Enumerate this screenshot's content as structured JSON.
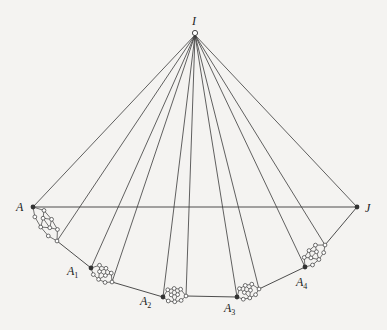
{
  "diagram": {
    "type": "geometric-construction",
    "colors": {
      "line": "#3a3a3a",
      "node_fill": "#ffffff",
      "joint_fill": "#333333",
      "background": "#f4f3f1"
    },
    "apex": {
      "label": "I",
      "x": 195,
      "y": 33
    },
    "baseline": {
      "from": "A",
      "to": "J"
    },
    "points": [
      {
        "id": "A",
        "label": "A",
        "sub": "",
        "x": 33,
        "y": 207,
        "label_x": 16,
        "label_y": 211
      },
      {
        "id": "A1",
        "label": "A",
        "sub": "1",
        "x": 91,
        "y": 268,
        "label_x": 67,
        "label_y": 275
      },
      {
        "id": "A2",
        "label": "A",
        "sub": "2",
        "x": 163,
        "y": 297,
        "label_x": 140,
        "label_y": 305
      },
      {
        "id": "A3",
        "label": "A",
        "sub": "3",
        "x": 237,
        "y": 297,
        "label_x": 224,
        "label_y": 312
      },
      {
        "id": "A4",
        "label": "A",
        "sub": "4",
        "x": 305,
        "y": 267,
        "label_x": 296,
        "label_y": 286
      },
      {
        "id": "J",
        "label": "J",
        "sub": "",
        "x": 357,
        "y": 207,
        "label_x": 365,
        "label_y": 212
      }
    ],
    "segments": [
      {
        "from": [
          33,
          207
        ],
        "to": [
          57,
          241
        ]
      },
      {
        "from": [
          91,
          268
        ],
        "to": [
          112,
          282
        ]
      },
      {
        "from": [
          163,
          297
        ],
        "to": [
          186,
          296
        ]
      },
      {
        "from": [
          237,
          297
        ],
        "to": [
          259,
          289
        ]
      },
      {
        "from": [
          305,
          267
        ],
        "to": [
          325,
          245
        ]
      }
    ],
    "connectors": [
      {
        "from": [
          57,
          241
        ],
        "to": [
          91,
          268
        ]
      },
      {
        "from": [
          112,
          282
        ],
        "to": [
          163,
          297
        ]
      },
      {
        "from": [
          186,
          296
        ],
        "to": [
          237,
          297
        ]
      },
      {
        "from": [
          259,
          289
        ],
        "to": [
          305,
          267
        ]
      },
      {
        "from": [
          325,
          245
        ],
        "to": [
          357,
          207
        ]
      }
    ],
    "rays_to": [
      [
        33,
        207
      ],
      [
        57,
        241
      ],
      [
        91,
        268
      ],
      [
        112,
        282
      ],
      [
        163,
        297
      ],
      [
        186,
        296
      ],
      [
        237,
        297
      ],
      [
        259,
        289
      ],
      [
        305,
        267
      ],
      [
        325,
        245
      ],
      [
        357,
        207
      ]
    ]
  }
}
